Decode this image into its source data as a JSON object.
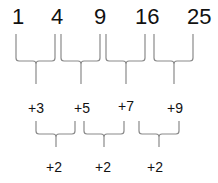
{
  "sequence": [
    "1",
    "4",
    "9",
    "16",
    "25"
  ],
  "first_differences": [
    "+3",
    "+5",
    "+7",
    "+9"
  ],
  "second_differences": [
    "+2",
    "+2",
    "+2"
  ],
  "colors": {
    "text": "#111111",
    "brace": "#8a8a8a",
    "background": "#ffffff"
  }
}
